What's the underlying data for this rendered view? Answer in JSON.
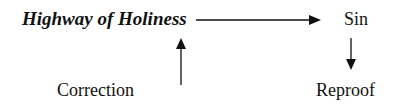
{
  "diagram": {
    "nodes": {
      "highway": "Highway of Holiness",
      "sin": "Sin",
      "reproof": "Reproof",
      "correction": "Correction"
    },
    "edges": [
      {
        "from": "Highway of Holiness",
        "to": "Sin",
        "direction": "right"
      },
      {
        "from": "Sin",
        "to": "Reproof",
        "direction": "down"
      },
      {
        "from": "Correction",
        "to": "Highway of Holiness",
        "direction": "up"
      }
    ],
    "colors": {
      "text": "#111111",
      "arrow": "#111111",
      "background": "#ffffff"
    }
  }
}
